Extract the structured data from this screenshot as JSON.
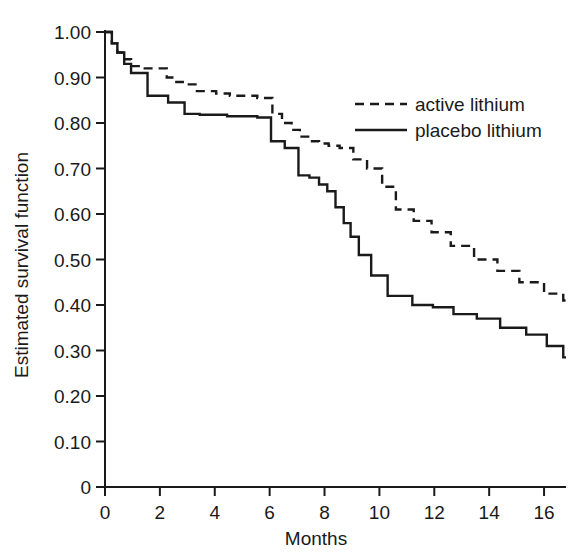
{
  "chart_data": {
    "type": "line",
    "subtype": "kaplan-meier-step",
    "title": "",
    "xlabel": "Months",
    "ylabel": "Estimated survival function",
    "xlim": [
      0,
      16.8
    ],
    "ylim": [
      0,
      1.0
    ],
    "xticks": [
      0,
      2,
      4,
      6,
      8,
      10,
      12,
      14,
      16
    ],
    "xticklabels": [
      "0",
      "2",
      "4",
      "6",
      "8",
      "10",
      "12",
      "14",
      "16"
    ],
    "yticks": [
      0,
      0.1,
      0.2,
      0.3,
      0.4,
      0.5,
      0.6,
      0.7,
      0.8,
      0.9,
      1.0
    ],
    "yticklabels": [
      "0",
      "0.10",
      "0.20",
      "0.30",
      "0.40",
      "0.50",
      "0.60",
      "0.70",
      "0.80",
      "0.90",
      "1.00"
    ],
    "grid": false,
    "legend_position": "upper right",
    "line_color": "#1a1a1a",
    "series": [
      {
        "name": "active lithium",
        "style": "dashed",
        "color": "#1a1a1a",
        "x": [
          0.0,
          0.25,
          0.45,
          0.7,
          0.95,
          1.45,
          2.25,
          2.6,
          3.0,
          3.35,
          4.05,
          4.55,
          5.55,
          6.1,
          6.45,
          6.8,
          7.1,
          7.45,
          7.8,
          8.15,
          8.55,
          9.05,
          9.55,
          10.1,
          10.6,
          11.25,
          11.9,
          12.6,
          13.45,
          14.3,
          15.1,
          16.0,
          16.7
        ],
        "y": [
          1.0,
          0.975,
          0.955,
          0.94,
          0.925,
          0.92,
          0.9,
          0.89,
          0.885,
          0.87,
          0.865,
          0.86,
          0.855,
          0.82,
          0.8,
          0.785,
          0.77,
          0.76,
          0.755,
          0.75,
          0.745,
          0.72,
          0.7,
          0.66,
          0.61,
          0.585,
          0.56,
          0.53,
          0.5,
          0.475,
          0.45,
          0.425,
          0.41
        ]
      },
      {
        "name": "placebo lithium",
        "style": "solid",
        "color": "#1a1a1a",
        "x": [
          0.0,
          0.25,
          0.45,
          0.7,
          0.95,
          1.55,
          2.3,
          2.9,
          3.45,
          4.45,
          5.55,
          6.05,
          6.55,
          7.05,
          7.45,
          7.8,
          8.1,
          8.4,
          8.7,
          8.95,
          9.25,
          9.7,
          10.3,
          11.2,
          11.95,
          12.7,
          13.55,
          14.4,
          15.35,
          16.1,
          16.7
        ],
        "y": [
          1.0,
          0.975,
          0.955,
          0.93,
          0.91,
          0.86,
          0.845,
          0.82,
          0.818,
          0.815,
          0.812,
          0.76,
          0.745,
          0.685,
          0.68,
          0.665,
          0.65,
          0.615,
          0.58,
          0.55,
          0.51,
          0.465,
          0.42,
          0.4,
          0.395,
          0.38,
          0.37,
          0.35,
          0.335,
          0.31,
          0.285
        ]
      }
    ]
  },
  "legend": {
    "entries": [
      {
        "label": "active lithium",
        "style": "dashed"
      },
      {
        "label": "placebo lithium",
        "style": "solid"
      }
    ]
  },
  "axes": {
    "x_title": "Months",
    "y_title": "Estimated survival function"
  }
}
